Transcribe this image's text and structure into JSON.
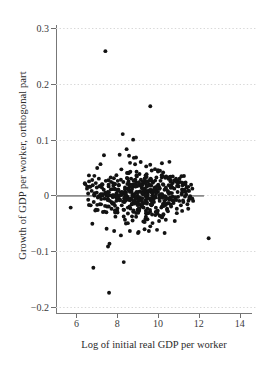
{
  "chart_data": {
    "type": "scatter",
    "title": "",
    "xlabel": "Log of initial real GDP per worker",
    "ylabel": "Growth of GDP per worker, orthogonal part",
    "xlim": [
      5.0,
      14.8
    ],
    "ylim": [
      -0.215,
      0.315
    ],
    "xticks": [
      6,
      8,
      10,
      12,
      14
    ],
    "xtick_labels": [
      "6",
      "8",
      "10",
      "12",
      "14"
    ],
    "yticks": [
      0.3,
      0.2,
      0.1,
      0,
      -0.1,
      -0.2
    ],
    "ytick_labels": [
      "0.3",
      "0.2",
      "0.1",
      "0",
      "−0.1",
      "−0.2"
    ],
    "grid": true,
    "grid_axis": "y",
    "grid_style": "dotted",
    "grid_color": "#d8d8d8",
    "legend": null,
    "marker": {
      "shape": "circle",
      "color": "#121212",
      "size_px": 3.9
    },
    "reference_line": {
      "type": "horizontal",
      "y": 0,
      "x_start": 5.05,
      "x_end": 12.25,
      "color": "#8a8a8a",
      "width_px": 1.6
    },
    "annotations": [],
    "point_count": 512,
    "points": [
      [
        7.42,
        0.259
      ],
      [
        9.62,
        0.16
      ],
      [
        8.27,
        0.11
      ],
      [
        8.78,
        0.1
      ],
      [
        5.72,
        -0.022
      ],
      [
        6.78,
        -0.051
      ],
      [
        6.83,
        -0.13
      ],
      [
        8.32,
        -0.12
      ],
      [
        7.6,
        -0.175
      ],
      [
        12.48,
        -0.077
      ],
      [
        7.55,
        -0.092
      ],
      [
        7.62,
        -0.087
      ],
      [
        7.35,
        0.072
      ],
      [
        8.12,
        0.073
      ],
      [
        8.58,
        0.071
      ],
      [
        8.46,
        0.083
      ],
      [
        8.92,
        0.068
      ],
      [
        9.15,
        0.06
      ],
      [
        7.02,
        0.049
      ],
      [
        7.18,
        0.056
      ],
      [
        6.88,
        0.035
      ],
      [
        6.95,
        0.022
      ],
      [
        11.35,
        0.023
      ],
      [
        11.62,
        0.019
      ],
      [
        11.05,
        0.03
      ],
      [
        10.72,
        0.034
      ],
      [
        10.25,
        0.041
      ],
      [
        9.85,
        0.047
      ],
      [
        9.42,
        0.052
      ],
      [
        11.18,
        -0.028
      ],
      [
        11.48,
        -0.024
      ],
      [
        10.92,
        -0.032
      ],
      [
        10.38,
        -0.044
      ],
      [
        9.95,
        -0.062
      ],
      [
        9.55,
        -0.064
      ],
      [
        9.05,
        -0.066
      ],
      [
        8.62,
        -0.064
      ],
      [
        8.18,
        -0.072
      ],
      [
        7.85,
        -0.064
      ],
      [
        7.48,
        -0.06
      ],
      [
        10.82,
        -0.046
      ],
      [
        10.05,
        -0.046
      ],
      [
        9.28,
        -0.047
      ],
      [
        8.52,
        -0.05
      ],
      [
        6.52,
        0.012
      ],
      [
        6.58,
        -0.008
      ],
      [
        6.62,
        0.025
      ],
      [
        6.7,
        -0.018
      ],
      [
        6.75,
        0.008
      ],
      [
        6.8,
        0.018
      ],
      [
        6.85,
        -0.012
      ],
      [
        6.9,
        0.004
      ],
      [
        6.96,
        -0.026
      ],
      [
        7.0,
        0.014
      ],
      [
        7.05,
        -0.004
      ],
      [
        7.1,
        0.03
      ],
      [
        7.15,
        -0.016
      ],
      [
        7.2,
        0.002
      ],
      [
        7.25,
        0.02
      ],
      [
        7.3,
        -0.03
      ],
      [
        7.34,
        0.01
      ],
      [
        7.38,
        -0.006
      ],
      [
        7.44,
        0.026
      ],
      [
        7.5,
        -0.02
      ],
      [
        7.54,
        0.006
      ],
      [
        7.58,
        0.016
      ],
      [
        7.64,
        -0.01
      ],
      [
        7.68,
        0.032
      ],
      [
        7.72,
        -0.024
      ],
      [
        7.76,
        0.0
      ],
      [
        7.8,
        0.022
      ],
      [
        7.84,
        -0.014
      ],
      [
        7.88,
        0.012
      ],
      [
        7.92,
        -0.002
      ],
      [
        7.96,
        0.036
      ],
      [
        8.0,
        -0.028
      ],
      [
        8.04,
        0.008
      ],
      [
        8.08,
        0.018
      ],
      [
        8.14,
        -0.008
      ],
      [
        8.18,
        0.028
      ],
      [
        8.22,
        -0.018
      ],
      [
        8.26,
        0.004
      ],
      [
        8.3,
        0.024
      ],
      [
        8.34,
        -0.012
      ],
      [
        8.38,
        0.014
      ],
      [
        8.42,
        -0.002
      ],
      [
        8.48,
        0.04
      ],
      [
        8.52,
        -0.022
      ],
      [
        8.56,
        0.01
      ],
      [
        8.6,
        0.02
      ],
      [
        8.64,
        -0.006
      ],
      [
        8.68,
        0.03
      ],
      [
        8.72,
        -0.016
      ],
      [
        8.76,
        0.002
      ],
      [
        8.8,
        0.026
      ],
      [
        8.84,
        -0.01
      ],
      [
        8.88,
        0.016
      ],
      [
        8.92,
        -0.004
      ],
      [
        8.96,
        0.034
      ],
      [
        9.0,
        -0.026
      ],
      [
        9.04,
        0.006
      ],
      [
        9.08,
        0.018
      ],
      [
        9.12,
        -0.008
      ],
      [
        9.16,
        0.028
      ],
      [
        9.2,
        -0.02
      ],
      [
        9.24,
        0.004
      ],
      [
        9.28,
        0.022
      ],
      [
        9.32,
        -0.014
      ],
      [
        9.36,
        0.012
      ],
      [
        9.4,
        -0.002
      ],
      [
        9.44,
        0.038
      ],
      [
        9.48,
        -0.024
      ],
      [
        9.52,
        0.008
      ],
      [
        9.56,
        0.02
      ],
      [
        9.6,
        -0.006
      ],
      [
        9.64,
        0.03
      ],
      [
        9.68,
        -0.018
      ],
      [
        9.72,
        0.0
      ],
      [
        9.76,
        0.024
      ],
      [
        9.8,
        -0.012
      ],
      [
        9.84,
        0.014
      ],
      [
        9.88,
        -0.004
      ],
      [
        9.92,
        0.032
      ],
      [
        9.96,
        -0.028
      ],
      [
        10.0,
        0.006
      ],
      [
        10.04,
        0.016
      ],
      [
        10.08,
        -0.01
      ],
      [
        10.12,
        0.026
      ],
      [
        10.16,
        -0.022
      ],
      [
        10.2,
        0.002
      ],
      [
        10.24,
        0.02
      ],
      [
        10.28,
        -0.016
      ],
      [
        10.32,
        0.01
      ],
      [
        10.36,
        -0.002
      ],
      [
        10.4,
        0.034
      ],
      [
        10.44,
        -0.026
      ],
      [
        10.48,
        0.008
      ],
      [
        10.52,
        0.018
      ],
      [
        10.56,
        -0.008
      ],
      [
        10.6,
        0.028
      ],
      [
        10.64,
        -0.02
      ],
      [
        10.68,
        0.004
      ],
      [
        10.72,
        0.022
      ],
      [
        10.76,
        -0.014
      ],
      [
        10.8,
        0.012
      ],
      [
        10.84,
        -0.004
      ],
      [
        10.88,
        0.03
      ],
      [
        10.92,
        -0.024
      ],
      [
        10.96,
        0.006
      ],
      [
        11.0,
        0.016
      ],
      [
        11.04,
        -0.01
      ],
      [
        11.08,
        0.024
      ],
      [
        11.12,
        -0.018
      ],
      [
        11.16,
        0.002
      ],
      [
        11.2,
        0.018
      ],
      [
        11.24,
        -0.012
      ],
      [
        11.28,
        0.01
      ],
      [
        11.32,
        -0.002
      ],
      [
        11.4,
        0.014
      ],
      [
        11.44,
        -0.016
      ],
      [
        11.52,
        0.008
      ],
      [
        11.56,
        -0.006
      ],
      [
        11.68,
        0.012
      ],
      [
        11.72,
        -0.01
      ]
    ]
  },
  "axis": {
    "line_color": "#777777",
    "tick_color": "#6e6e6e"
  }
}
